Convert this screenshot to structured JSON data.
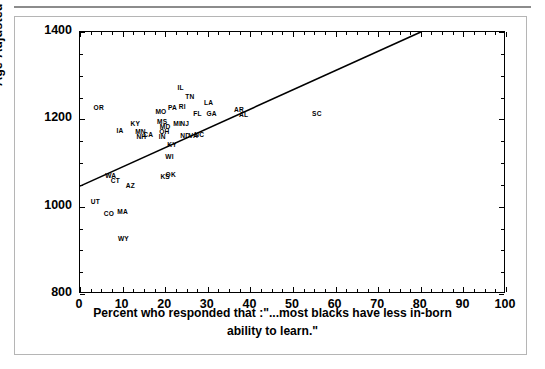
{
  "chart_data": {
    "type": "scatter",
    "title": "",
    "xlabel": "Percent who responded that :\"...most blacks have less in-born ability to learn.\"",
    "xlabel_line1": "Percent who responded that :\"...most blacks have less in-born",
    "xlabel_line2": "ability to learn.\"",
    "ylabel": "Age-Adjusted Black Mortality Rate",
    "xlim": [
      0,
      100
    ],
    "ylim": [
      800,
      1400
    ],
    "xticks": [
      0,
      10,
      20,
      30,
      40,
      50,
      60,
      70,
      80,
      90,
      100
    ],
    "yticks": [
      800,
      1000,
      1200,
      1400
    ],
    "xtick_labels": [
      "0",
      "10",
      "20",
      "30",
      "40",
      "50",
      "60",
      "70",
      "80",
      "90",
      "100"
    ],
    "ytick_labels": [
      "800",
      "1000",
      "1200",
      "1400"
    ],
    "grid": false,
    "legend": "none",
    "point_marker": "state-abbreviation-text",
    "trendline": {
      "type": "linear",
      "x_start": 0,
      "y_start": 1047,
      "x_end": 80,
      "y_end": 1400,
      "color": "#000000"
    },
    "points": [
      {
        "label": "OR",
        "x": 4.4,
        "y": 1228
      },
      {
        "label": "IA",
        "x": 9.4,
        "y": 1175
      },
      {
        "label": "KY",
        "x": 13.0,
        "y": 1192
      },
      {
        "label": "MN",
        "x": 14.2,
        "y": 1173
      },
      {
        "label": "NH",
        "x": 14.4,
        "y": 1161
      },
      {
        "label": "CA",
        "x": 16.0,
        "y": 1166
      },
      {
        "label": "MO",
        "x": 19.0,
        "y": 1219
      },
      {
        "label": "MS",
        "x": 19.3,
        "y": 1196
      },
      {
        "label": "MD",
        "x": 20.0,
        "y": 1184
      },
      {
        "label": "OH",
        "x": 19.8,
        "y": 1174
      },
      {
        "label": "IN",
        "x": 19.3,
        "y": 1162
      },
      {
        "label": "PA",
        "x": 21.7,
        "y": 1228
      },
      {
        "label": "RI",
        "x": 24.0,
        "y": 1230
      },
      {
        "label": "IL",
        "x": 23.6,
        "y": 1275
      },
      {
        "label": "MI",
        "x": 22.8,
        "y": 1192
      },
      {
        "label": "NJ",
        "x": 24.6,
        "y": 1192
      },
      {
        "label": "KY2",
        "x": 21.6,
        "y": 1144
      },
      {
        "label": "WI",
        "x": 21.0,
        "y": 1117
      },
      {
        "label": "ND",
        "x": 24.7,
        "y": 1163
      },
      {
        "label": "VA",
        "x": 26.6,
        "y": 1165
      },
      {
        "label": "NC",
        "x": 28.0,
        "y": 1166
      },
      {
        "label": "TN",
        "x": 25.8,
        "y": 1253
      },
      {
        "label": "FL",
        "x": 27.6,
        "y": 1215
      },
      {
        "label": "LA",
        "x": 30.2,
        "y": 1240
      },
      {
        "label": "GA",
        "x": 30.9,
        "y": 1214
      },
      {
        "label": "AR",
        "x": 37.3,
        "y": 1224
      },
      {
        "label": "AL",
        "x": 38.4,
        "y": 1213
      },
      {
        "label": "SC",
        "x": 55.6,
        "y": 1214
      },
      {
        "label": "WA",
        "x": 7.2,
        "y": 1073
      },
      {
        "label": "CT",
        "x": 8.3,
        "y": 1060
      },
      {
        "label": "AZ",
        "x": 11.8,
        "y": 1050
      },
      {
        "label": "KS",
        "x": 20.0,
        "y": 1071
      },
      {
        "label": "OK",
        "x": 21.3,
        "y": 1075
      },
      {
        "label": "UT",
        "x": 3.6,
        "y": 1013
      },
      {
        "label": "CO",
        "x": 6.8,
        "y": 985
      },
      {
        "label": "MA",
        "x": 10.0,
        "y": 989
      },
      {
        "label": "WY",
        "x": 10.2,
        "y": 928
      }
    ],
    "labels_rendered": [
      "OR",
      "IA",
      "KY",
      "MN",
      "NH",
      "CA",
      "MO",
      "MS",
      "MD",
      "OH",
      "IN",
      "PA",
      "RI",
      "IL",
      "MI",
      "NJ",
      "KY",
      "WI",
      "ND",
      "VA",
      "NC",
      "TN",
      "FL",
      "LA",
      "GA",
      "AR",
      "AL",
      "SC",
      "WA",
      "CT",
      "AZ",
      "KS",
      "OK",
      "UT",
      "CO",
      "MA",
      "WY"
    ]
  }
}
